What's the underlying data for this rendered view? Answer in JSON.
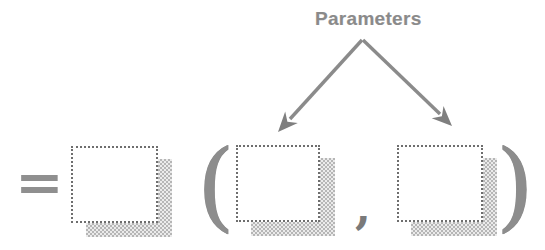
{
  "figure": {
    "annotation": {
      "label": "Parameters"
    },
    "expression": {
      "equals": "=",
      "open_paren": "(",
      "comma": ",",
      "close_paren": ")"
    },
    "icons": {
      "left_arrow": "arrow-down-left-icon",
      "right_arrow": "arrow-down-right-icon"
    },
    "colors": {
      "label_text": "#8a8a8a",
      "arrow": "#8b8b8b",
      "box_border": "#6e6e6e",
      "shadow_checker": "#b6b6b6",
      "background": "#ffffff"
    }
  }
}
